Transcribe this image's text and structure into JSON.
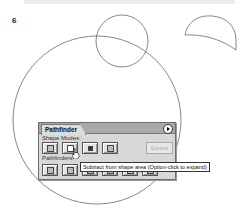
{
  "figure": {
    "step_number": "6"
  },
  "canvas": {
    "shapes": [
      {
        "type": "circle",
        "name": "large-circle"
      },
      {
        "type": "circle",
        "name": "small-circle"
      },
      {
        "type": "crescent",
        "name": "result-shape"
      }
    ]
  },
  "panel": {
    "title": "Pathfinder",
    "menu_icon": "panel-menu-arrow-icon",
    "shape_modes": {
      "label": "Shape Modes:",
      "buttons": [
        {
          "name": "add-to-shape-area",
          "icon": "add-icon"
        },
        {
          "name": "subtract-from-shape-area",
          "icon": "subtract-icon"
        },
        {
          "name": "intersect-shape-areas",
          "icon": "intersect-icon"
        },
        {
          "name": "exclude-overlapping-areas",
          "icon": "exclude-icon"
        }
      ],
      "expand_label": "Expand"
    },
    "pathfinders": {
      "label": "Pathfinders:",
      "buttons": [
        {
          "name": "divide",
          "icon": "divide-icon"
        },
        {
          "name": "trim",
          "icon": "trim-icon"
        },
        {
          "name": "merge",
          "icon": "merge-icon"
        },
        {
          "name": "crop",
          "icon": "crop-icon"
        },
        {
          "name": "outline",
          "icon": "outline-icon"
        },
        {
          "name": "minus-back",
          "icon": "minus-back-icon"
        }
      ]
    }
  },
  "tooltip": {
    "text": "Subtract from shape area (Option-click to expand)"
  }
}
